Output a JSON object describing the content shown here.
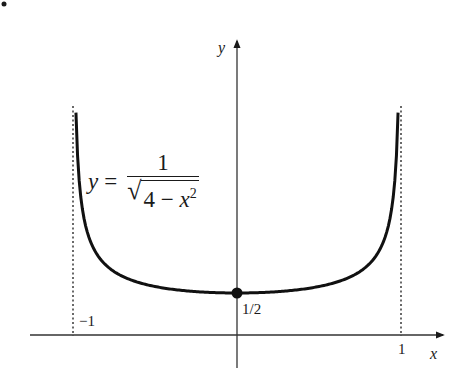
{
  "chart_data": {
    "type": "line",
    "title": "",
    "xlabel": "x",
    "ylabel": "y",
    "function_label": {
      "lhs": "y",
      "equals": "=",
      "numerator": "1",
      "radicand_const": "4 −",
      "radicand_var": "x",
      "radicand_exp": "2"
    },
    "x_ticks": [
      {
        "value": -1,
        "label": "−1"
      },
      {
        "value": 1,
        "label": "1"
      }
    ],
    "y_ticks": [
      {
        "value": 0.5,
        "label": "1/2"
      }
    ],
    "asymptotes": [
      -1,
      1
    ],
    "highlighted_point": {
      "x": 0,
      "y": 0.5,
      "label": "1/2"
    },
    "xlim": [
      -1.26,
      1.26
    ],
    "ylim": [
      -0.38,
      3.48
    ],
    "grid": false,
    "legend": null,
    "series": [
      {
        "name": "y = 1/sqrt(4 - x^2)",
        "x": [
          -0.98,
          -0.95,
          -0.9,
          -0.8,
          -0.7,
          -0.6,
          -0.5,
          -0.4,
          -0.3,
          -0.2,
          -0.1,
          0,
          0.1,
          0.2,
          0.3,
          0.4,
          0.5,
          0.6,
          0.7,
          0.8,
          0.9,
          0.95,
          0.98
        ],
        "y": [
          2.51,
          1.6,
          1.15,
          0.83,
          0.7,
          0.63,
          0.58,
          0.55,
          0.52,
          0.51,
          0.5,
          0.5,
          0.5,
          0.51,
          0.52,
          0.55,
          0.58,
          0.63,
          0.7,
          0.83,
          1.15,
          1.6,
          2.51
        ]
      }
    ]
  },
  "axis_labels": {
    "x": "x",
    "y": "y"
  },
  "tick_labels": {
    "neg_one": "−1",
    "one": "1",
    "half": "1/2"
  },
  "bullet": "•"
}
